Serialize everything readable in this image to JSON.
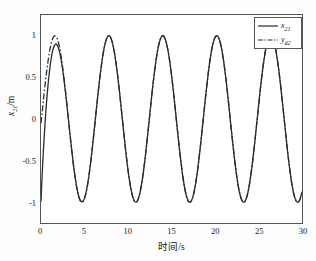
{
  "chart_data": {
    "type": "line",
    "title": "",
    "xlabel": "时间/s",
    "ylabel": "x₂₁/m",
    "xlim": [
      0,
      30
    ],
    "ylim": [
      -1.25,
      1.25
    ],
    "xticks": [
      0,
      5,
      10,
      15,
      20,
      25,
      30
    ],
    "yticks": [
      1,
      0.5,
      0,
      -0.5,
      -1
    ],
    "xtick_labels": [
      "0",
      "5",
      "10",
      "15",
      "20",
      "25",
      "30"
    ],
    "ytick_labels": [
      "1",
      "0.5",
      "0",
      "-0.5",
      "-1"
    ],
    "grid": false,
    "legend_position": "top-right",
    "series": [
      {
        "name": "x21",
        "label": "x",
        "label_sub": "21",
        "style": "solid",
        "color": "#2b2b2b",
        "amplitude": 1.0,
        "period": 6.2,
        "phase_deg": -90,
        "transient": "first peak reaches only 0.82 at t=1.6 before converging",
        "peaks_t": [
          1.6,
          7.8,
          14.0,
          20.2,
          26.4
        ],
        "peaks_y": [
          0.82,
          1.0,
          1.0,
          1.0,
          1.0
        ],
        "troughs_t": [
          4.7,
          10.9,
          17.1,
          23.3,
          29.5
        ],
        "troughs_y": [
          -1.0,
          -1.0,
          -1.0,
          -1.0,
          -1.0
        ]
      },
      {
        "name": "yd2",
        "label": "y",
        "label_sub": "d2",
        "style": "dash-dot",
        "color": "#2b2b2b",
        "amplitude": 1.0,
        "period": 6.2,
        "phase_deg": -90,
        "transient": "none; ideal reference sinusoid",
        "peaks_t": [
          1.6,
          7.8,
          14.0,
          20.2,
          26.4
        ],
        "peaks_y": [
          1.0,
          1.0,
          1.0,
          1.0,
          1.0
        ],
        "troughs_t": [
          4.7,
          10.9,
          17.1,
          23.3,
          29.5
        ],
        "troughs_y": [
          -1.0,
          -1.0,
          -1.0,
          -1.0,
          -1.0
        ]
      }
    ]
  },
  "legend": {
    "entries": [
      {
        "label": "x",
        "sub": "21"
      },
      {
        "label": "y",
        "sub": "d2"
      }
    ]
  }
}
